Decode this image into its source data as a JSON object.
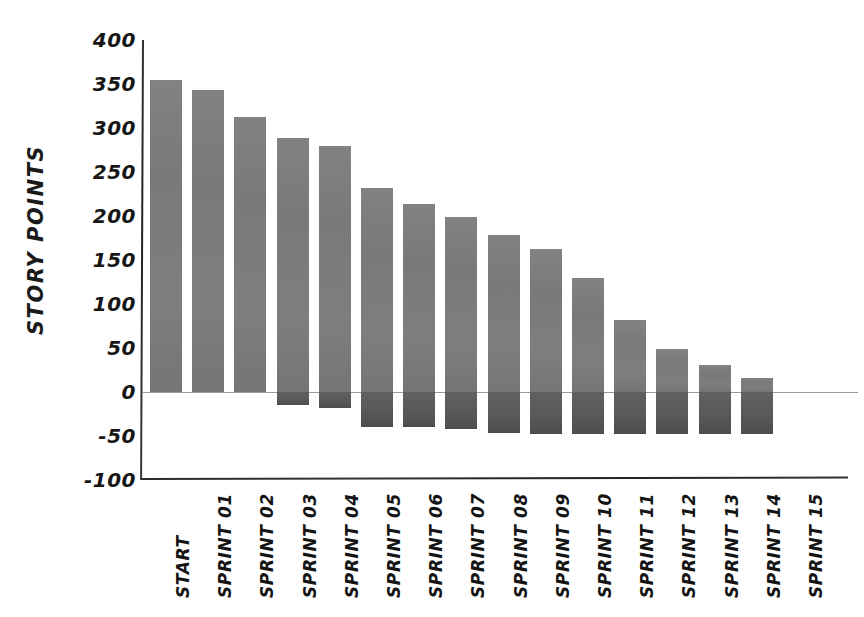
{
  "chart_data": {
    "type": "bar",
    "title": "",
    "subtitle": "",
    "xlabel": "",
    "ylabel": "STORY POINTS",
    "ylim": [
      -100,
      400
    ],
    "yticks": [
      400,
      350,
      300,
      250,
      200,
      150,
      100,
      50,
      0,
      -50,
      -100
    ],
    "grid": false,
    "legend": "none",
    "categories": [
      "START",
      "SPRINT 01",
      "SPRINT 02",
      "SPRINT 03",
      "SPRINT 04",
      "SPRINT 05",
      "SPRINT 06",
      "SPRINT 07",
      "SPRINT 08",
      "SPRINT 09",
      "SPRINT 10",
      "SPRINT 11",
      "SPRINT 12",
      "SPRINT 13",
      "SPRINT 14",
      "SPRINT 15"
    ],
    "series": [
      {
        "name": "Remaining story points",
        "color": "#7d7d7d",
        "values": [
          355,
          343,
          313,
          289,
          280,
          232,
          214,
          199,
          178,
          162,
          129,
          82,
          49,
          31,
          16,
          0
        ]
      },
      {
        "name": "Completed story points",
        "color": "#5c5c5c",
        "values": [
          0,
          0,
          0,
          -15,
          -18,
          -40,
          -40,
          -42,
          -47,
          -48,
          -48,
          -48,
          -48,
          -48,
          -48,
          0
        ]
      }
    ]
  },
  "axis": {
    "y_tick_labels": [
      "400",
      "350",
      "300",
      "250",
      "200",
      "150",
      "100",
      "50",
      "0",
      "-50",
      "-100"
    ],
    "zero_label": "0"
  }
}
